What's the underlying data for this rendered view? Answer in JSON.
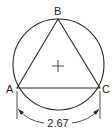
{
  "diagram": {
    "vertices": [
      {
        "label": "A",
        "x": 17,
        "y": 88
      },
      {
        "label": "B",
        "x": 58,
        "y": 19
      },
      {
        "label": "C",
        "x": 100,
        "y": 88
      }
    ],
    "circle": {
      "cx": 58.5,
      "cy": 64.5,
      "r": 45.5
    },
    "center_mark": {
      "x": 58,
      "y": 66,
      "size": 5
    },
    "dimension": {
      "value": "2.67",
      "from": "A",
      "to": "C"
    },
    "colors": {
      "line": "#2a2a2a",
      "background": "#ffffff"
    }
  }
}
